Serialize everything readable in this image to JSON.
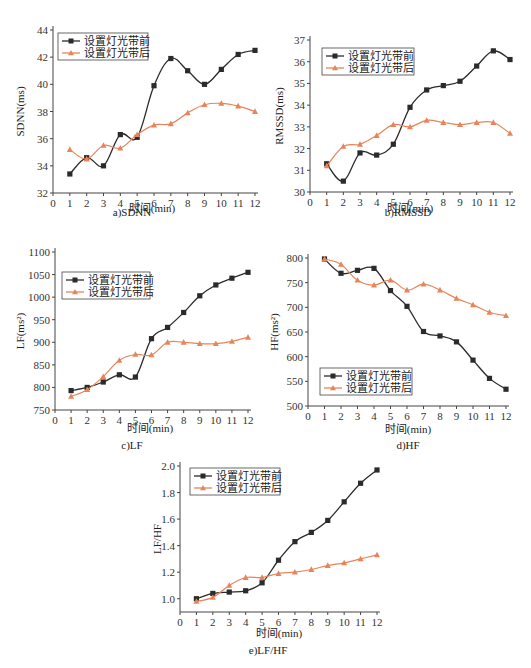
{
  "colors": {
    "before": "#2b2b2b",
    "after": "#e8845a",
    "axis": "#444444"
  },
  "legend": {
    "before": "设置灯光带前",
    "after": "设置灯光带后"
  },
  "xlabel": "时间(min)",
  "chart_data": [
    {
      "type": "line",
      "caption": "a)SDNN",
      "title": "",
      "xlabel": "时间(min)",
      "ylabel": "SDNN(ms)",
      "x": [
        1,
        2,
        3,
        4,
        5,
        6,
        7,
        8,
        9,
        10,
        11,
        12
      ],
      "xlim": [
        0,
        12
      ],
      "ylim": [
        32,
        44
      ],
      "yticks": [
        32,
        34,
        36,
        38,
        40,
        42,
        44
      ],
      "legend_position": "upper left",
      "grid": false,
      "series": [
        {
          "name": "设置灯光带前",
          "marker": "square",
          "values": [
            33.4,
            34.6,
            34.0,
            36.3,
            36.1,
            39.9,
            41.9,
            41.0,
            40.0,
            41.1,
            42.2,
            42.5
          ]
        },
        {
          "name": "设置灯光带后",
          "marker": "triangle",
          "values": [
            35.2,
            34.5,
            35.5,
            35.3,
            36.3,
            37.0,
            37.1,
            37.9,
            38.5,
            38.6,
            38.4,
            38.0
          ]
        }
      ]
    },
    {
      "type": "line",
      "caption": "b)RMSSD",
      "title": "",
      "xlabel": "时间(min)",
      "ylabel": "RMSSD(ms)",
      "x": [
        1,
        2,
        3,
        4,
        5,
        6,
        7,
        8,
        9,
        10,
        11,
        12
      ],
      "xlim": [
        0,
        12
      ],
      "ylim": [
        30,
        37
      ],
      "yticks": [
        30,
        31,
        32,
        33,
        34,
        35,
        36,
        37
      ],
      "legend_position": "upper left",
      "grid": false,
      "series": [
        {
          "name": "设置灯光带前",
          "marker": "square",
          "values": [
            31.3,
            30.5,
            31.8,
            31.7,
            32.2,
            33.9,
            34.7,
            34.9,
            35.1,
            35.8,
            36.5,
            36.1
          ]
        },
        {
          "name": "设置灯光带后",
          "marker": "triangle",
          "values": [
            31.2,
            32.1,
            32.2,
            32.6,
            33.1,
            33.0,
            33.3,
            33.2,
            33.1,
            33.2,
            33.2,
            32.7
          ]
        }
      ]
    },
    {
      "type": "line",
      "caption": "c)LF",
      "title": "",
      "xlabel": "时间(min)",
      "ylabel": "LF(ms²)",
      "x": [
        1,
        2,
        3,
        4,
        5,
        6,
        7,
        8,
        9,
        10,
        11,
        12
      ],
      "xlim": [
        0,
        12
      ],
      "ylim": [
        750,
        1100
      ],
      "yticks": [
        750,
        800,
        850,
        900,
        950,
        1000,
        1050,
        1100
      ],
      "legend_position": "upper left",
      "grid": false,
      "series": [
        {
          "name": "设置灯光带前",
          "marker": "square",
          "values": [
            793,
            800,
            812,
            828,
            823,
            908,
            933,
            966,
            1003,
            1027,
            1042,
            1055
          ]
        },
        {
          "name": "设置灯光带后",
          "marker": "triangle",
          "values": [
            780,
            795,
            824,
            860,
            873,
            872,
            900,
            900,
            897,
            897,
            902,
            911
          ]
        }
      ]
    },
    {
      "type": "line",
      "caption": "d)HF",
      "title": "",
      "xlabel": "时间(min)",
      "ylabel": "HF(ms²)",
      "x": [
        1,
        2,
        3,
        4,
        5,
        6,
        7,
        8,
        9,
        10,
        11,
        12
      ],
      "xlim": [
        0,
        12
      ],
      "ylim": [
        500,
        800
      ],
      "yticks": [
        500,
        550,
        600,
        650,
        700,
        750,
        800
      ],
      "legend_position": "lower left",
      "grid": false,
      "series": [
        {
          "name": "设置灯光带前",
          "marker": "square",
          "values": [
            798,
            769,
            775,
            779,
            734,
            702,
            651,
            642,
            630,
            593,
            556,
            534
          ]
        },
        {
          "name": "设置灯光带后",
          "marker": "triangle",
          "values": [
            798,
            787,
            755,
            745,
            755,
            735,
            747,
            735,
            718,
            705,
            690,
            683
          ]
        }
      ]
    },
    {
      "type": "line",
      "caption": "e)LF/HF",
      "title": "",
      "xlabel": "时间(min)",
      "ylabel": "LF/HF",
      "x": [
        1,
        2,
        3,
        4,
        5,
        6,
        7,
        8,
        9,
        10,
        11,
        12
      ],
      "xlim": [
        0,
        12
      ],
      "ylim": [
        0.9,
        2.0
      ],
      "yticks": [
        1.0,
        1.2,
        1.4,
        1.6,
        1.8,
        2.0
      ],
      "legend_position": "upper left",
      "grid": false,
      "series": [
        {
          "name": "设置灯光带前",
          "marker": "square",
          "values": [
            1.0,
            1.04,
            1.05,
            1.06,
            1.12,
            1.29,
            1.43,
            1.5,
            1.59,
            1.73,
            1.87,
            1.97
          ]
        },
        {
          "name": "设置灯光带后",
          "marker": "triangle",
          "values": [
            0.98,
            1.01,
            1.1,
            1.16,
            1.16,
            1.19,
            1.2,
            1.22,
            1.25,
            1.27,
            1.3,
            1.33
          ]
        }
      ]
    }
  ]
}
